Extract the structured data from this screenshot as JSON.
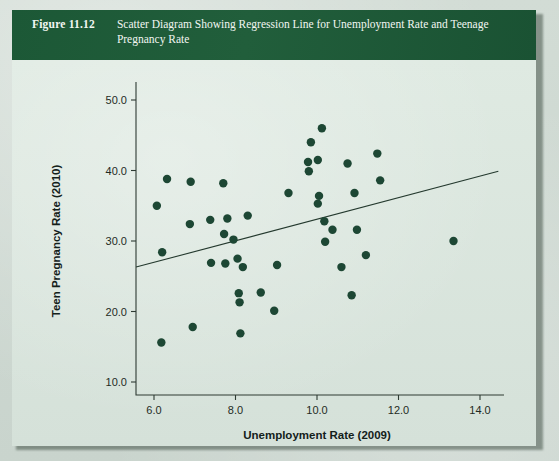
{
  "figure": {
    "number_label": "Figure 11.12",
    "caption_line1": "Scatter Diagram Showing Regression Line for Unemployment Rate and",
    "caption_line2": "Teenage Pregnancy Rate",
    "caption_full": "Scatter Diagram Showing Regression Line for Unemployment Rate and Teenage Pregnancy Rate",
    "band_color": "#1c5836",
    "panel_color": "#dbe7df",
    "ink_color": "#1d4734"
  },
  "chart_data": {
    "type": "scatter",
    "title": "Scatter Diagram Showing Regression Line for Unemployment Rate and Teenage Pregnancy Rate",
    "xlabel": "Unemployment Rate (2009)",
    "ylabel": "Teen Pregnancy Rate (2010)",
    "xlim": [
      5.2,
      14.8
    ],
    "ylim": [
      7.5,
      52.5
    ],
    "xticks": [
      6.0,
      8.0,
      10.0,
      12.0,
      14.0
    ],
    "xtick_labels": [
      "6.0",
      "8.0",
      "10.0",
      "12.0",
      "14.0"
    ],
    "yticks": [
      10.0,
      20.0,
      30.0,
      40.0,
      50.0
    ],
    "ytick_labels": [
      "10.0",
      "20.0",
      "30.0",
      "40.0",
      "50.0"
    ],
    "grid": false,
    "legend": null,
    "marker_color": "#1d4734",
    "marker_size": 4.2,
    "points": [
      {
        "x": 6.07,
        "y": 35.0
      },
      {
        "x": 6.2,
        "y": 28.4
      },
      {
        "x": 6.18,
        "y": 15.6
      },
      {
        "x": 6.32,
        "y": 38.8
      },
      {
        "x": 6.9,
        "y": 38.4
      },
      {
        "x": 6.88,
        "y": 32.4
      },
      {
        "x": 6.95,
        "y": 17.8
      },
      {
        "x": 7.38,
        "y": 33.0
      },
      {
        "x": 7.4,
        "y": 26.9
      },
      {
        "x": 7.7,
        "y": 38.2
      },
      {
        "x": 7.72,
        "y": 31.0
      },
      {
        "x": 7.75,
        "y": 26.8
      },
      {
        "x": 7.8,
        "y": 33.2
      },
      {
        "x": 7.95,
        "y": 30.2
      },
      {
        "x": 8.05,
        "y": 27.5
      },
      {
        "x": 8.08,
        "y": 22.6
      },
      {
        "x": 8.1,
        "y": 21.3
      },
      {
        "x": 8.12,
        "y": 16.9
      },
      {
        "x": 8.18,
        "y": 26.3
      },
      {
        "x": 8.3,
        "y": 33.6
      },
      {
        "x": 8.62,
        "y": 22.7
      },
      {
        "x": 8.95,
        "y": 20.1
      },
      {
        "x": 9.02,
        "y": 26.6
      },
      {
        "x": 9.3,
        "y": 36.8
      },
      {
        "x": 9.85,
        "y": 44.0
      },
      {
        "x": 9.78,
        "y": 41.2
      },
      {
        "x": 9.8,
        "y": 39.9
      },
      {
        "x": 10.02,
        "y": 41.5
      },
      {
        "x": 10.12,
        "y": 46.0
      },
      {
        "x": 10.05,
        "y": 36.4
      },
      {
        "x": 10.02,
        "y": 35.3
      },
      {
        "x": 10.18,
        "y": 32.8
      },
      {
        "x": 10.38,
        "y": 31.6
      },
      {
        "x": 10.2,
        "y": 29.9
      },
      {
        "x": 10.6,
        "y": 26.3
      },
      {
        "x": 10.75,
        "y": 41.0
      },
      {
        "x": 10.92,
        "y": 36.8
      },
      {
        "x": 10.98,
        "y": 31.6
      },
      {
        "x": 10.85,
        "y": 22.3
      },
      {
        "x": 11.2,
        "y": 28.0
      },
      {
        "x": 11.48,
        "y": 42.4
      },
      {
        "x": 11.55,
        "y": 38.6
      },
      {
        "x": 13.35,
        "y": 30.0
      }
    ],
    "regression_line": {
      "x_start": 5.56,
      "y_start": 26.3,
      "x_end": 14.45,
      "y_end": 39.9,
      "color": "#24392e"
    }
  }
}
